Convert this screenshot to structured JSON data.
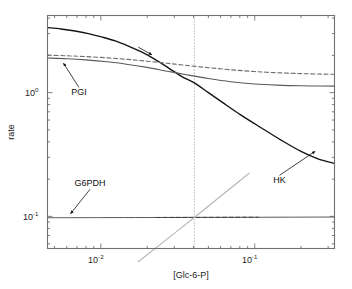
{
  "chart_data": {
    "type": "line",
    "title": "",
    "xlabel": "[Glc-6-P]",
    "ylabel": "rate",
    "xscale": "log",
    "yscale": "log",
    "xlim": [
      0.0045,
      0.33
    ],
    "ylim": [
      0.055,
      4.2
    ],
    "grid": false,
    "legend_position": "none",
    "xticks": [
      {
        "value": 0.01,
        "label": "10",
        "exp": "-2"
      },
      {
        "value": 0.1,
        "label": "10",
        "exp": "-1"
      }
    ],
    "yticks": [
      {
        "value": 1.0,
        "label": "10",
        "exp": "0"
      },
      {
        "value": 0.1,
        "label": "10",
        "exp": "-1"
      }
    ],
    "annotations": [
      {
        "name": "pgi-label",
        "text": "PGI",
        "x": 0.0072,
        "y": 0.95,
        "points_to_x": 0.0056,
        "points_to_y": 1.8
      },
      {
        "name": "g6pdh-label",
        "text": "G6PDH",
        "x": 0.0085,
        "y": 0.175,
        "points_to_x": 0.0062,
        "points_to_y": 0.101
      },
      {
        "name": "hk-label",
        "text": "HK",
        "x": 0.145,
        "y": 0.185,
        "points_to_x": 0.255,
        "points_to_y": 0.345
      }
    ],
    "reference_line": {
      "name": "vertical-marker",
      "x": 0.0405,
      "style": "dotted"
    },
    "series": [
      {
        "name": "HK",
        "style": "solid",
        "color": "#141414",
        "width": 1.4,
        "x": [
          0.0045,
          0.0055,
          0.0068,
          0.0083,
          0.0101,
          0.0124,
          0.0151,
          0.0185,
          0.0226,
          0.0276,
          0.0338,
          0.0405,
          0.05,
          0.062,
          0.082,
          0.11,
          0.15,
          0.2,
          0.26,
          0.33
        ],
        "y": [
          3.35,
          3.27,
          3.15,
          3.0,
          2.82,
          2.62,
          2.38,
          2.12,
          1.85,
          1.58,
          1.34,
          1.2,
          1.0,
          0.83,
          0.655,
          0.52,
          0.41,
          0.335,
          0.29,
          0.268
        ]
      },
      {
        "name": "PGI-solid",
        "style": "solid",
        "color": "#5a5a5a",
        "width": 1.1,
        "x": [
          0.0045,
          0.006,
          0.008,
          0.011,
          0.015,
          0.02,
          0.027,
          0.036,
          0.05,
          0.07,
          0.1,
          0.14,
          0.2,
          0.27,
          0.33
        ],
        "y": [
          1.905,
          1.88,
          1.84,
          1.775,
          1.69,
          1.6,
          1.49,
          1.395,
          1.3,
          1.225,
          1.175,
          1.15,
          1.135,
          1.13,
          1.128
        ]
      },
      {
        "name": "PGI-dashed",
        "style": "dashed",
        "color": "#6e6e6e",
        "width": 1.1,
        "x": [
          0.0045,
          0.006,
          0.008,
          0.011,
          0.015,
          0.02,
          0.027,
          0.036,
          0.05,
          0.07,
          0.1,
          0.14,
          0.2,
          0.27,
          0.33
        ],
        "y": [
          2.01,
          1.985,
          1.955,
          1.91,
          1.855,
          1.795,
          1.725,
          1.66,
          1.59,
          1.53,
          1.48,
          1.448,
          1.425,
          1.412,
          1.408
        ]
      },
      {
        "name": "G6PDH",
        "style": "solid",
        "color": "#5a5a5a",
        "width": 1.0,
        "x": [
          0.0045,
          0.01,
          0.02,
          0.0405,
          0.08,
          0.16,
          0.33
        ],
        "y": [
          0.0975,
          0.0977,
          0.0979,
          0.0981,
          0.0983,
          0.0985,
          0.0988
        ]
      },
      {
        "name": "G6PDH-dashed-overlay",
        "style": "dashed",
        "color": "#3a3a3a",
        "width": 1.0,
        "x": [
          0.023,
          0.0405,
          0.07,
          0.105
        ],
        "y": [
          0.098,
          0.0981,
          0.0983,
          0.0984
        ]
      },
      {
        "name": "rising-reference",
        "style": "solid",
        "color": "#b8b8b8",
        "width": 1.2,
        "x": [
          0.0175,
          0.0405,
          0.092
        ],
        "y": [
          0.043,
          0.098,
          0.223
        ]
      }
    ]
  },
  "figure": {
    "background": "#ffffff",
    "frame_color": "#707070",
    "tick_color": "#707070"
  }
}
